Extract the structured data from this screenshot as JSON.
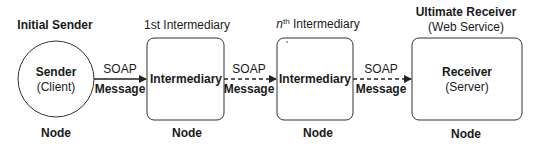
{
  "diagram": {
    "type": "soap-message-path",
    "nodes": [
      {
        "role": "Initial Sender",
        "name": "Sender",
        "sub": "(Client)",
        "shape": "circle",
        "footer": "Node"
      },
      {
        "role": "1st Intermediary",
        "name": "Intermediary",
        "sub": "",
        "shape": "rounded-rect",
        "footer": "Node"
      },
      {
        "role_prefix": "n",
        "role_sup": "th",
        "role_suffix": " Intermediary",
        "name": "Intermediary",
        "sub": "",
        "shape": "rounded-rect",
        "footer": "Node"
      },
      {
        "role": "Ultimate Receiver",
        "role_sub": "(Web Service)",
        "name": "Receiver",
        "sub": "(Server)",
        "shape": "rounded-rect",
        "footer": "Node"
      }
    ],
    "edges": [
      {
        "from": 0,
        "to": 1,
        "top": "SOAP",
        "bottom": "Message",
        "style": "solid"
      },
      {
        "from": 1,
        "to": 2,
        "top": "SOAP",
        "bottom": "Message",
        "style": "dashed"
      },
      {
        "from": 2,
        "to": 3,
        "top": "SOAP",
        "bottom": "Message",
        "style": "dashed"
      }
    ],
    "colors": {
      "stroke": "#333333",
      "text": "#1a1a1a",
      "background": "#ffffff"
    }
  }
}
